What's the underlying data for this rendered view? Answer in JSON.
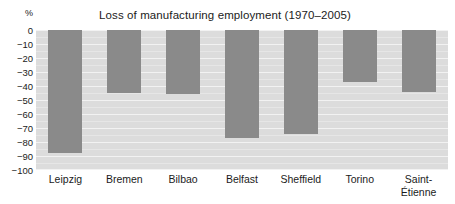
{
  "chart_data": {
    "type": "bar",
    "title": "Loss of manufacturing employment (1970–2005)",
    "xlabel": "",
    "ylabel": "%",
    "categories": [
      "Leipzig",
      "Bremen",
      "Bilbao",
      "Belfast",
      "Sheffield",
      "Torino",
      "Saint-Étienne"
    ],
    "values": [
      -88,
      -45,
      -46,
      -77,
      -74,
      -37,
      -44
    ],
    "ylim": [
      -100,
      0
    ],
    "ytick_labels": [
      "0",
      "−10",
      "−20",
      "−30",
      "−40",
      "−50",
      "−60",
      "−70",
      "−80",
      "−90",
      "−100"
    ],
    "ytick_values": [
      0,
      -10,
      -20,
      -30,
      -40,
      -50,
      -60,
      -70,
      -80,
      -90,
      -100
    ],
    "grid": true,
    "legend": false,
    "legend_position": "none",
    "bar_color": "#8a8a8a",
    "plot_background": "#dcdcdc",
    "gridline_color": "#f2f2f2",
    "figure_background": "#ffffff",
    "text_color": "#1b1b1b"
  },
  "axis": {
    "unit_label": "%"
  },
  "category_labels": [
    {
      "line1": "Leipzig",
      "line2": ""
    },
    {
      "line1": "Bremen",
      "line2": ""
    },
    {
      "line1": "Bilbao",
      "line2": ""
    },
    {
      "line1": "Belfast",
      "line2": ""
    },
    {
      "line1": "Sheffield",
      "line2": ""
    },
    {
      "line1": "Torino",
      "line2": ""
    },
    {
      "line1": "Saint-",
      "line2": "Étienne"
    }
  ]
}
